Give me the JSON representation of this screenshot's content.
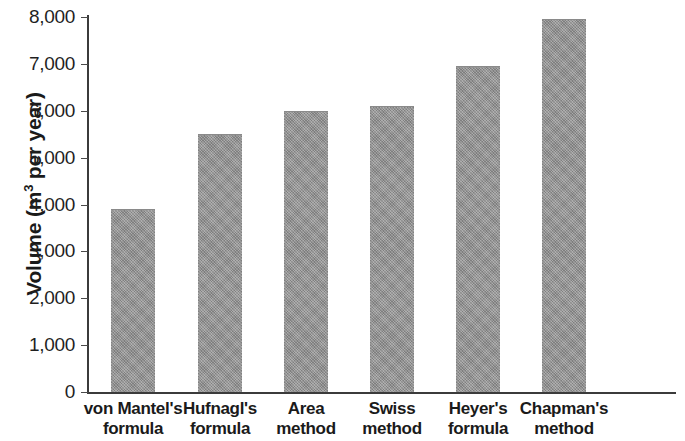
{
  "chart_data": {
    "type": "bar",
    "title": "",
    "subtitle": "",
    "xlabel": "",
    "ylabel": "Volume (m3 per year)",
    "ylabel_parts": {
      "pre": "Volume (m",
      "sup": "3",
      "post": " per year)"
    },
    "categories": [
      "von Mantel's formula",
      "Hufnagl's formula",
      "Area method",
      "Swiss method",
      "Heyer's formula",
      "Chapman's method"
    ],
    "category_lines": [
      [
        "von Mantel's",
        "formula"
      ],
      [
        "Hufnagl's",
        "formula"
      ],
      [
        "Area",
        "method"
      ],
      [
        "Swiss",
        "method"
      ],
      [
        "Heyer's",
        "formula"
      ],
      [
        "Chapman's",
        "method"
      ]
    ],
    "values": [
      3900,
      5500,
      6000,
      6100,
      6950,
      7950
    ],
    "ylim": [
      0,
      8000
    ],
    "ytick_values": [
      0,
      1000,
      2000,
      3000,
      4000,
      5000,
      6000,
      7000,
      8000
    ],
    "ytick_labels": [
      "0",
      "1,000",
      "2,000",
      "3,000",
      "4,000",
      "5,000",
      "6,000",
      "7,000",
      "8,000"
    ],
    "grid": false,
    "legend": null,
    "bar_color": "#979797",
    "axis_color": "#3b3b3b",
    "text_color": "#1a1a1a"
  }
}
